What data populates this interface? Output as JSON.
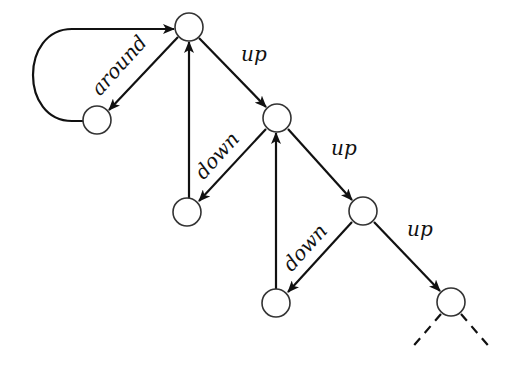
{
  "diagram": {
    "title": "",
    "nodes": [
      {
        "id": "n1",
        "cx": 189,
        "cy": 27
      },
      {
        "id": "n2",
        "cx": 97,
        "cy": 120
      },
      {
        "id": "n3",
        "cx": 277,
        "cy": 118
      },
      {
        "id": "n4",
        "cx": 187,
        "cy": 212
      },
      {
        "id": "n5",
        "cx": 363,
        "cy": 211
      },
      {
        "id": "n6",
        "cx": 276,
        "cy": 303
      },
      {
        "id": "n7",
        "cx": 451,
        "cy": 302
      }
    ],
    "edges": [
      {
        "from": "n1",
        "to": "n2",
        "label": "around"
      },
      {
        "from": "n2",
        "to": "n1",
        "label": "",
        "style": "loop"
      },
      {
        "from": "n1",
        "to": "n3",
        "label": "up"
      },
      {
        "from": "n3",
        "to": "n4",
        "label": "down"
      },
      {
        "from": "n4",
        "to": "n1",
        "label": ""
      },
      {
        "from": "n3",
        "to": "n5",
        "label": "up"
      },
      {
        "from": "n5",
        "to": "n6",
        "label": "down"
      },
      {
        "from": "n6",
        "to": "n3",
        "label": ""
      },
      {
        "from": "n5",
        "to": "n7",
        "label": "up"
      },
      {
        "from": "n7",
        "to": "continuation-left",
        "label": "",
        "style": "dashed"
      },
      {
        "from": "n7",
        "to": "continuation-right",
        "label": "",
        "style": "dashed"
      }
    ],
    "labels": {
      "around": "around",
      "up1": "up",
      "down1": "down",
      "up2": "up",
      "down2": "down",
      "up3": "up"
    }
  }
}
